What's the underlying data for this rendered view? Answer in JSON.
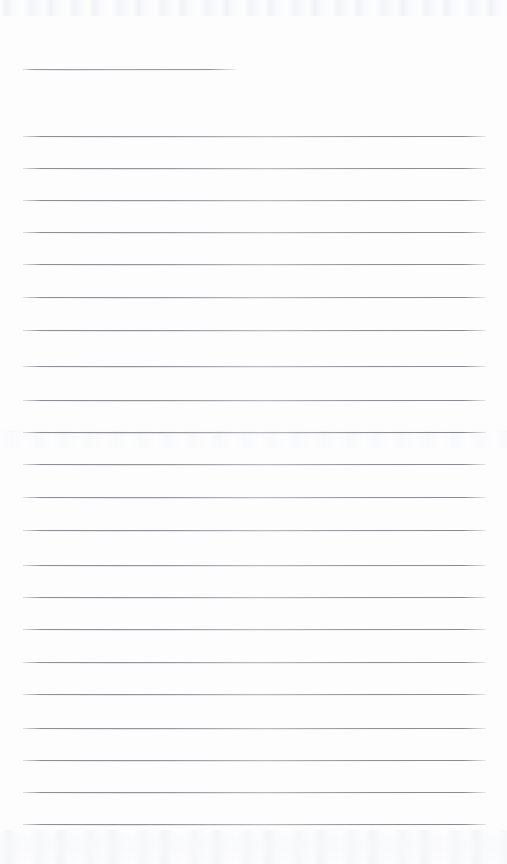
{
  "page": {
    "kind": "lined-notepad-page",
    "width": 507,
    "height": 864,
    "background_color": "#fdfdfe",
    "rule_color": "#8a8f96",
    "content_text": "",
    "notes_text": ""
  },
  "ruling": {
    "left_margin_x": 23,
    "right_edge_x": 486,
    "line_spacing": 32.3,
    "first_line_y": 69,
    "first_line_right_x": 236,
    "total_lines": 24,
    "header_rule_label": "header-rule",
    "body_rule_label": "body-rule"
  },
  "lines": [
    {
      "y": 69,
      "x1": 23,
      "x2": 236,
      "kind": "short"
    },
    {
      "y": 136,
      "x1": 23,
      "x2": 486,
      "kind": "full"
    },
    {
      "y": 168,
      "x1": 23,
      "x2": 486,
      "kind": "full"
    },
    {
      "y": 200,
      "x1": 23,
      "x2": 486,
      "kind": "full"
    },
    {
      "y": 232,
      "x1": 23,
      "x2": 486,
      "kind": "full"
    },
    {
      "y": 264,
      "x1": 23,
      "x2": 486,
      "kind": "full"
    },
    {
      "y": 297,
      "x1": 23,
      "x2": 486,
      "kind": "full"
    },
    {
      "y": 330,
      "x1": 23,
      "x2": 486,
      "kind": "full"
    },
    {
      "y": 366,
      "x1": 23,
      "x2": 486,
      "kind": "full"
    },
    {
      "y": 400,
      "x1": 23,
      "x2": 486,
      "kind": "full"
    },
    {
      "y": 432,
      "x1": 23,
      "x2": 486,
      "kind": "full"
    },
    {
      "y": 464,
      "x1": 23,
      "x2": 486,
      "kind": "full"
    },
    {
      "y": 497,
      "x1": 23,
      "x2": 486,
      "kind": "full"
    },
    {
      "y": 530,
      "x1": 23,
      "x2": 486,
      "kind": "full"
    },
    {
      "y": 565,
      "x1": 23,
      "x2": 486,
      "kind": "full"
    },
    {
      "y": 597,
      "x1": 23,
      "x2": 486,
      "kind": "full"
    },
    {
      "y": 629,
      "x1": 23,
      "x2": 486,
      "kind": "full"
    },
    {
      "y": 662,
      "x1": 23,
      "x2": 486,
      "kind": "full"
    },
    {
      "y": 694,
      "x1": 23,
      "x2": 486,
      "kind": "full"
    },
    {
      "y": 728,
      "x1": 23,
      "x2": 486,
      "kind": "full"
    },
    {
      "y": 760,
      "x1": 23,
      "x2": 486,
      "kind": "full"
    },
    {
      "y": 792,
      "x1": 23,
      "x2": 486,
      "kind": "full"
    },
    {
      "y": 824,
      "x1": 23,
      "x2": 486,
      "kind": "full"
    }
  ]
}
